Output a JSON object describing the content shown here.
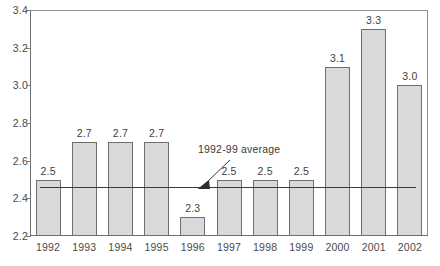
{
  "chart_data": {
    "type": "bar",
    "title": "",
    "subtitle": "",
    "xlabel": "",
    "ylabel": "",
    "categories": [
      "1992",
      "1993",
      "1994",
      "1995",
      "1996",
      "1997",
      "1998",
      "1999",
      "2000",
      "2001",
      "2002"
    ],
    "values": [
      2.5,
      2.7,
      2.7,
      2.7,
      2.3,
      2.5,
      2.5,
      2.5,
      3.1,
      3.3,
      3.0
    ],
    "data_labels": [
      "2.5",
      "2.7",
      "2.7",
      "2.7",
      "2.3",
      "2.5",
      "2.5",
      "2.5",
      "3.1",
      "3.3",
      "3.0"
    ],
    "ylim": [
      2.2,
      3.4
    ],
    "ytick_values": [
      2.2,
      2.4,
      2.6,
      2.8,
      3.0,
      3.2,
      3.4
    ],
    "ytick_labels": [
      "2.2",
      "2.4",
      "2.6",
      "2.8",
      "3.0",
      "3.2",
      "3.4"
    ],
    "grid": false,
    "legend": false,
    "annotations": [
      {
        "name": "average-line",
        "text": "1992-99 average",
        "value": 2.4625,
        "style": "horizontal reference line with leader and arrowhead"
      }
    ],
    "colors": {
      "bar_fill": "#d9d9d9",
      "bar_border": "#6f6f6f",
      "axis": "#6e6e6e",
      "frame": "#9a9a9a",
      "text": "#3a3a3a",
      "average_line": "#3c3c3c"
    }
  }
}
